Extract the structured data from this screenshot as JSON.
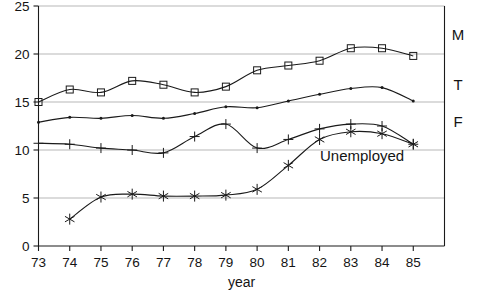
{
  "chart_data": {
    "type": "line",
    "title": "",
    "subtitle": "",
    "xlabel": "year",
    "ylabel": "",
    "x": [
      73,
      74,
      75,
      76,
      77,
      78,
      79,
      80,
      81,
      82,
      83,
      84,
      85
    ],
    "xtick_labels": [
      "73",
      "74",
      "75",
      "76",
      "77",
      "78",
      "79",
      "80",
      "81",
      "82",
      "83",
      "84",
      "85"
    ],
    "ytick_labels": [
      "0",
      "5",
      "10",
      "15",
      "20",
      "25"
    ],
    "yticks": [
      0,
      5,
      10,
      15,
      20,
      25
    ],
    "xlim": [
      73,
      86
    ],
    "ylim": [
      0,
      25
    ],
    "grid": "horizontal",
    "legend_position": "inline-right",
    "series": [
      {
        "name": "M",
        "label": "M",
        "marker": "square",
        "x": [
          73,
          74,
          75,
          76,
          77,
          78,
          79,
          80,
          81,
          82,
          83,
          84,
          85
        ],
        "values": [
          15.0,
          16.3,
          16.0,
          17.2,
          16.8,
          16.0,
          16.6,
          18.3,
          18.8,
          19.3,
          20.6,
          20.6,
          19.8
        ]
      },
      {
        "name": "T",
        "label": "T",
        "marker": "dot",
        "x": [
          73,
          74,
          75,
          76,
          77,
          78,
          79,
          80,
          81,
          82,
          83,
          84,
          85
        ],
        "values": [
          12.9,
          13.4,
          13.3,
          13.6,
          13.3,
          13.8,
          14.5,
          14.4,
          15.1,
          15.8,
          16.4,
          16.5,
          15.1
        ]
      },
      {
        "name": "F",
        "label": "F",
        "marker": "plus",
        "x": [
          73,
          74,
          75,
          76,
          77,
          78,
          79,
          80,
          81,
          82,
          83,
          84,
          85
        ],
        "values": [
          10.7,
          10.6,
          10.2,
          10.0,
          9.7,
          11.4,
          12.7,
          10.2,
          11.1,
          12.2,
          12.7,
          12.5,
          10.6
        ]
      },
      {
        "name": "Unemployed",
        "label": "Unemployed",
        "marker": "asterisk",
        "x": [
          74,
          75,
          76,
          77,
          78,
          79,
          80,
          81,
          82,
          83,
          84,
          85
        ],
        "values": [
          2.8,
          5.1,
          5.4,
          5.2,
          5.2,
          5.3,
          5.9,
          8.4,
          11.1,
          11.9,
          11.7,
          10.6
        ]
      }
    ],
    "colors": {
      "line": "#1a1a1a",
      "grid": "#9a9a9a",
      "axis": "#1a1a1a",
      "text": "#141414",
      "background": "#ffffff"
    }
  }
}
